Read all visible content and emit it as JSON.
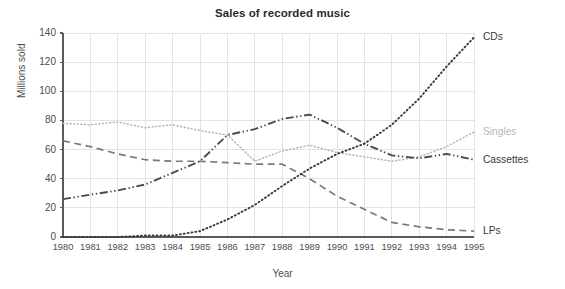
{
  "chart_data": {
    "type": "line",
    "title": "Sales of recorded music",
    "xlabel": "Year",
    "ylabel": "Millions sold",
    "categories": [
      1980,
      1981,
      1982,
      1983,
      1984,
      1985,
      1986,
      1987,
      1988,
      1989,
      1990,
      1991,
      1992,
      1993,
      1994,
      1995
    ],
    "x": [
      "1980",
      "1981",
      "1982",
      "1983",
      "1984",
      "1985",
      "1986",
      "1987",
      "1988",
      "1989",
      "1990",
      "1991",
      "1992",
      "1993",
      "1994",
      "1995"
    ],
    "xlim": [
      1980,
      1995
    ],
    "ylim": [
      0,
      140
    ],
    "yticks": [
      "0",
      "20",
      "40",
      "60",
      "80",
      "100",
      "120",
      "140"
    ],
    "ytick_values": [
      0,
      20,
      40,
      60,
      80,
      100,
      120,
      140
    ],
    "grid": true,
    "legend_position": "right-inline-labels",
    "series": [
      {
        "name": "Singles",
        "color": "#b6b6b6",
        "style": "dotted",
        "values": [
          78,
          77,
          79,
          75,
          77,
          73,
          70,
          52,
          59,
          63,
          58,
          55,
          52,
          55,
          62,
          72
        ]
      },
      {
        "name": "LPs",
        "color": "#7a7a7a",
        "style": "dashed",
        "values": [
          66,
          62,
          57,
          53,
          52,
          52,
          51,
          50,
          50,
          40,
          28,
          19,
          10,
          7,
          5,
          4
        ]
      },
      {
        "name": "Cassettes",
        "color": "#4a4a4a",
        "style": "dash-dot-dot",
        "values": [
          26,
          29,
          32,
          36,
          44,
          52,
          70,
          74,
          81,
          84,
          75,
          64,
          56,
          54,
          57,
          53
        ]
      },
      {
        "name": "CDs",
        "color": "#3a3a3a",
        "style": "fine-dotted",
        "values": [
          0,
          0,
          0,
          1,
          1,
          4,
          12,
          22,
          35,
          47,
          57,
          64,
          77,
          95,
          117,
          137
        ]
      }
    ],
    "series_labels": [
      {
        "name": "CDs",
        "value": 137,
        "color": "#3a3a3a"
      },
      {
        "name": "Singles",
        "value": 72,
        "color": "#b6b6b6"
      },
      {
        "name": "Cassettes",
        "value": 53,
        "color": "#3a3a3a"
      },
      {
        "name": "LPs",
        "value": 4,
        "color": "#3a3a3a"
      }
    ],
    "colors": {
      "grid": "#e3e3e6",
      "axis": "#5a5a5a",
      "title": "#2b2b2b",
      "tick_text": "#4d4d4d"
    }
  }
}
